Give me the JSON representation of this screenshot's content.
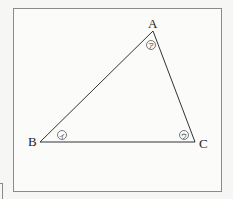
{
  "diagram": {
    "type": "triangle",
    "vertices": [
      {
        "label": "A",
        "x": 153,
        "y": 31
      },
      {
        "label": "B",
        "x": 40,
        "y": 142
      },
      {
        "label": "C",
        "x": 195,
        "y": 142
      }
    ],
    "angle_marks": [
      {
        "vertex": "A",
        "symbol": "ア"
      },
      {
        "vertex": "B",
        "symbol": "イ"
      },
      {
        "vertex": "C",
        "symbol": "ウ"
      }
    ],
    "line_color": "#333333"
  }
}
